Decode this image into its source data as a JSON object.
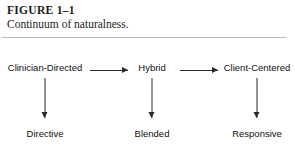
{
  "figure": {
    "number_label": "FIGURE 1–1",
    "caption": "Continuum of naturalness.",
    "rule_color": "#b9b9b9",
    "text_color": "#1c1c1c",
    "arrow_color": "#2a2a2a",
    "background": "#ffffff"
  },
  "chart_data": {
    "type": "diagram",
    "title": "Continuum of naturalness.",
    "orientation": "left-to-right continuum with downward outcome arrows",
    "top_row": {
      "nodes": [
        {
          "label": "Clinician-Directed",
          "x": 45
        },
        {
          "label": "Hybrid",
          "x": 152
        },
        {
          "label": "Client-Centered",
          "x": 257
        }
      ],
      "connectors": [
        {
          "from": "Clinician-Directed",
          "to": "Hybrid",
          "style": "horizontal-arrow",
          "direction": "right"
        },
        {
          "from": "Hybrid",
          "to": "Client-Centered",
          "style": "horizontal-arrow",
          "direction": "right"
        }
      ]
    },
    "bottom_row": {
      "nodes": [
        {
          "label": "Directive",
          "x": 45
        },
        {
          "label": "Blended",
          "x": 152
        },
        {
          "label": "Responsive",
          "x": 257
        }
      ]
    },
    "vertical_connectors": [
      {
        "from": "Clinician-Directed",
        "to": "Directive",
        "style": "vertical-arrow",
        "direction": "down"
      },
      {
        "from": "Hybrid",
        "to": "Blended",
        "style": "vertical-arrow",
        "direction": "down"
      },
      {
        "from": "Client-Centered",
        "to": "Responsive",
        "style": "vertical-arrow",
        "direction": "down"
      }
    ]
  }
}
